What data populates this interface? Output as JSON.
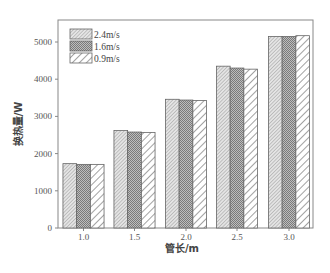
{
  "chart_data": {
    "type": "bar",
    "title": "",
    "xlabel": "管长/m",
    "ylabel": "换热量/W",
    "categories": [
      "1.0",
      "1.5",
      "2.0",
      "2.5",
      "3.0"
    ],
    "series": [
      {
        "name": "2.4m/s",
        "pattern": "fine-diagonal",
        "values": [
          1730,
          2620,
          3460,
          4350,
          5150
        ]
      },
      {
        "name": "1.6m/s",
        "pattern": "dense-crosshatch",
        "values": [
          1710,
          2580,
          3440,
          4300,
          5150
        ]
      },
      {
        "name": "0.9m/s",
        "pattern": "wide-diagonal",
        "values": [
          1710,
          2570,
          3430,
          4270,
          5170
        ]
      }
    ],
    "ylim": [
      0,
      5500
    ],
    "yticks": [
      0,
      1000,
      2000,
      3000,
      4000,
      5000
    ],
    "grid": false,
    "legend_position": "upper-left"
  },
  "colors": {
    "axis": "#777777",
    "bar_outline": "#666666",
    "hatch_light": "#9a9a9a",
    "hatch_dark": "#777777"
  }
}
